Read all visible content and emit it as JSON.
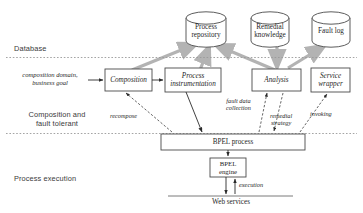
{
  "figure": {
    "colors": {
      "stroke": "#4a4a4a",
      "gray_arrow": "#b3b3b3",
      "divider": "#9a9a9a",
      "text": "#1f1f1f",
      "layer_text": "#3a3a3a",
      "background": "#ffffff"
    }
  },
  "layers": [
    {
      "id": "database",
      "label": "Database"
    },
    {
      "id": "composition-fault-tolerant",
      "label": "Composition and\nfault tolerant"
    },
    {
      "id": "process-execution",
      "label": "Process execution"
    }
  ],
  "datastores": [
    {
      "id": "process-repository",
      "label": "Process\nrepository"
    },
    {
      "id": "remedial-knowledge",
      "label": "Remedial\nknowledge"
    },
    {
      "id": "fault-log",
      "label": "Fault log"
    }
  ],
  "components": [
    {
      "id": "composition",
      "label": "Composition"
    },
    {
      "id": "process-instrumentation",
      "label": "Process\ninstrumentation"
    },
    {
      "id": "analysis",
      "label": "Analysis"
    },
    {
      "id": "service-wrapper",
      "label": "Service\nwrapper"
    },
    {
      "id": "bpel-process",
      "label": "BPEL process"
    },
    {
      "id": "bpel-engine",
      "label": "BPEL\nengine"
    }
  ],
  "endpoints": [
    {
      "id": "web-services",
      "label": "Web services"
    }
  ],
  "inputs": [
    {
      "id": "composition-input",
      "label": "composition domain,\nbusiness goal"
    }
  ],
  "edge_labels": [
    {
      "id": "recompose",
      "label": "recompose"
    },
    {
      "id": "fault-data-collection",
      "label": "fault data\ncollection"
    },
    {
      "id": "remedial-strategy",
      "label": "remedial\nstrategy"
    },
    {
      "id": "invoking",
      "label": "invoking"
    },
    {
      "id": "execution",
      "label": "execution"
    }
  ]
}
